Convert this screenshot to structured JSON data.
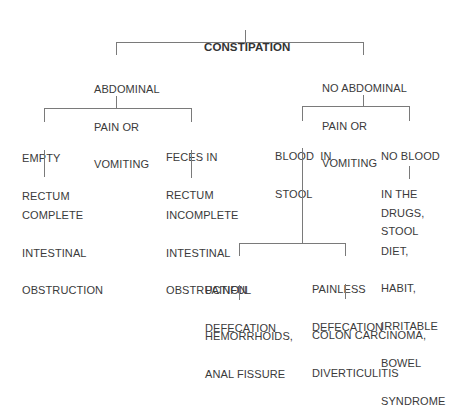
{
  "diagram": {
    "type": "decision-tree",
    "root": {
      "label": "CONSTIPATION"
    },
    "nodes": {
      "abd_pain": {
        "lines": [
          "ABDOMINAL",
          "PAIN OR",
          "VOMITING"
        ]
      },
      "no_abd_pain": {
        "lines": [
          "NO ABDOMINAL",
          "PAIN OR",
          "VOMITING"
        ]
      },
      "empty_rectum": {
        "lines": [
          "EMPTY",
          "RECTUM"
        ]
      },
      "feces_rectum": {
        "lines": [
          "FECES IN",
          "RECTUM"
        ]
      },
      "complete_obs": {
        "lines": [
          "COMPLETE",
          "INTESTINAL",
          "OBSTRUCTION"
        ]
      },
      "incomplete_obs": {
        "lines": [
          "INCOMPLETE",
          "INTESTINAL",
          "OBSTRUCTION"
        ]
      },
      "blood_stool": {
        "lines": [
          "BLOOD  IN",
          "STOOL"
        ]
      },
      "no_blood_stool": {
        "lines": [
          "NO BLOOD",
          "IN THE",
          "STOOL"
        ]
      },
      "drugs": {
        "lines": [
          "DRUGS,",
          "DIET,",
          "HABIT,",
          "IRRITABLE",
          "BOWEL",
          "SYNDROME"
        ]
      },
      "painful": {
        "lines": [
          "PAINFUL",
          "DEFECATION"
        ]
      },
      "painless": {
        "lines": [
          "PAINLESS",
          "DEFECATION"
        ]
      },
      "hemorrhoids": {
        "lines": [
          "HEMORRHOIDS,",
          "ANAL FISSURE"
        ]
      },
      "colon": {
        "lines": [
          "COLON CARCINOMA,",
          "DIVERTICULITIS"
        ]
      }
    },
    "edges": [
      [
        "CONSTIPATION",
        "ABDOMINAL PAIN OR VOMITING"
      ],
      [
        "CONSTIPATION",
        "NO ABDOMINAL PAIN OR VOMITING"
      ],
      [
        "ABDOMINAL PAIN OR VOMITING",
        "EMPTY RECTUM"
      ],
      [
        "ABDOMINAL PAIN OR VOMITING",
        "FECES IN RECTUM"
      ],
      [
        "EMPTY RECTUM",
        "COMPLETE INTESTINAL OBSTRUCTION"
      ],
      [
        "FECES IN RECTUM",
        "INCOMPLETE INTESTINAL OBSTRUCTION"
      ],
      [
        "NO ABDOMINAL PAIN OR VOMITING",
        "BLOOD IN STOOL"
      ],
      [
        "NO ABDOMINAL PAIN OR VOMITING",
        "NO BLOOD IN THE STOOL"
      ],
      [
        "NO BLOOD IN THE STOOL",
        "DRUGS, DIET, HABIT, IRRITABLE BOWEL SYNDROME"
      ],
      [
        "BLOOD IN STOOL",
        "PAINFUL DEFECATION"
      ],
      [
        "BLOOD IN STOOL",
        "PAINLESS DEFECATION"
      ],
      [
        "PAINFUL DEFECATION",
        "HEMORRHOIDS, ANAL FISSURE"
      ],
      [
        "PAINLESS DEFECATION",
        "COLON CARCINOMA, DIVERTICULITIS"
      ]
    ],
    "line_color": "#7a7a7a",
    "text_color": "#3a3a3a"
  }
}
